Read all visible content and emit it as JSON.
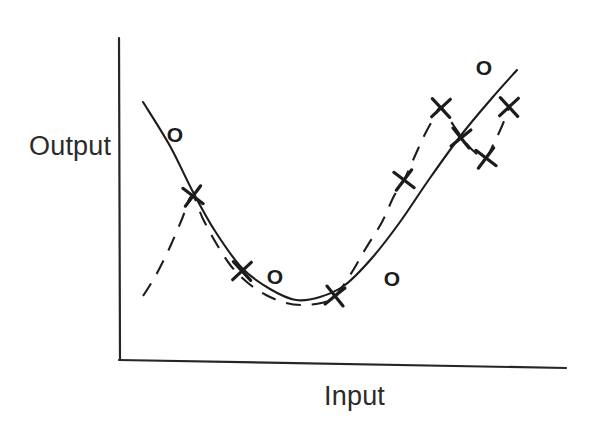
{
  "figure": {
    "title": "",
    "background_color": "#ffffff",
    "ink_color": "#1c1c1c",
    "axis_label_color": "#2b2b2b"
  },
  "axes": {
    "y_label": "Output",
    "x_label": "Input",
    "y_axis": {
      "x": 119,
      "y_top": 38,
      "y_bottom": 360
    },
    "x_axis": {
      "y_left": 360,
      "y_right": 368,
      "x_left": 119,
      "x_right": 566
    }
  },
  "chart_data": {
    "type": "scatter",
    "title": "",
    "xlabel": "Input",
    "ylabel": "Output",
    "grid": false,
    "legend": false,
    "xlim": [
      0,
      1
    ],
    "ylim": [
      0,
      1
    ],
    "note": "Hand-drawn style illustration: a U-shaped solid fitted curve (underfit / smooth model) and a wiggly dashed curve (overfit model) through scattered X training points, with O test points off the curves.",
    "series": [
      {
        "name": "solid-curve",
        "style": "solid",
        "role": "smooth-fit",
        "points_px": [
          [
            143,
            102
          ],
          [
            170,
            146
          ],
          [
            193,
            192
          ],
          [
            215,
            231
          ],
          [
            242,
            268
          ],
          [
            270,
            289
          ],
          [
            296,
            300
          ],
          [
            320,
            297
          ],
          [
            345,
            285
          ],
          [
            372,
            258
          ],
          [
            400,
            222
          ],
          [
            430,
            178
          ],
          [
            462,
            134
          ],
          [
            492,
            98
          ],
          [
            517,
            70
          ]
        ]
      },
      {
        "name": "dashed-curve",
        "style": "dashed",
        "role": "overfit-wiggly",
        "points_px": [
          [
            143,
            296
          ],
          [
            156,
            275
          ],
          [
            170,
            247
          ],
          [
            182,
            219
          ],
          [
            192,
            196
          ],
          [
            203,
            219
          ],
          [
            216,
            243
          ],
          [
            231,
            266
          ],
          [
            248,
            283
          ],
          [
            266,
            295
          ],
          [
            286,
            303
          ],
          [
            306,
            305
          ],
          [
            328,
            301
          ],
          [
            340,
            290
          ],
          [
            352,
            272
          ],
          [
            366,
            248
          ],
          [
            382,
            222
          ],
          [
            394,
            196
          ],
          [
            404,
            180
          ],
          [
            414,
            158
          ],
          [
            424,
            136
          ],
          [
            434,
            118
          ],
          [
            441,
            108
          ],
          [
            454,
            126
          ],
          [
            466,
            143
          ],
          [
            478,
            155
          ],
          [
            486,
            158
          ],
          [
            494,
            143
          ],
          [
            502,
            126
          ],
          [
            509,
            108
          ]
        ]
      }
    ],
    "markers": [
      {
        "symbol": "O",
        "label": "o",
        "x_px": 175,
        "y_px": 135
      },
      {
        "symbol": "O",
        "label": "o",
        "x_px": 275,
        "y_px": 277
      },
      {
        "symbol": "O",
        "label": "o",
        "x_px": 392,
        "y_px": 279
      },
      {
        "symbol": "O",
        "label": "o",
        "x_px": 484,
        "y_px": 68
      },
      {
        "symbol": "X",
        "label": "x",
        "x_px": 193,
        "y_px": 196
      },
      {
        "symbol": "X",
        "label": "x",
        "x_px": 242,
        "y_px": 271
      },
      {
        "symbol": "X",
        "label": "x",
        "x_px": 335,
        "y_px": 296
      },
      {
        "symbol": "X",
        "label": "x",
        "x_px": 404,
        "y_px": 180
      },
      {
        "symbol": "X",
        "label": "x",
        "x_px": 441,
        "y_px": 108
      },
      {
        "symbol": "X",
        "label": "x",
        "x_px": 461,
        "y_px": 138
      },
      {
        "symbol": "X",
        "label": "x",
        "x_px": 486,
        "y_px": 158
      },
      {
        "symbol": "X",
        "label": "x",
        "x_px": 509,
        "y_px": 107
      }
    ]
  }
}
